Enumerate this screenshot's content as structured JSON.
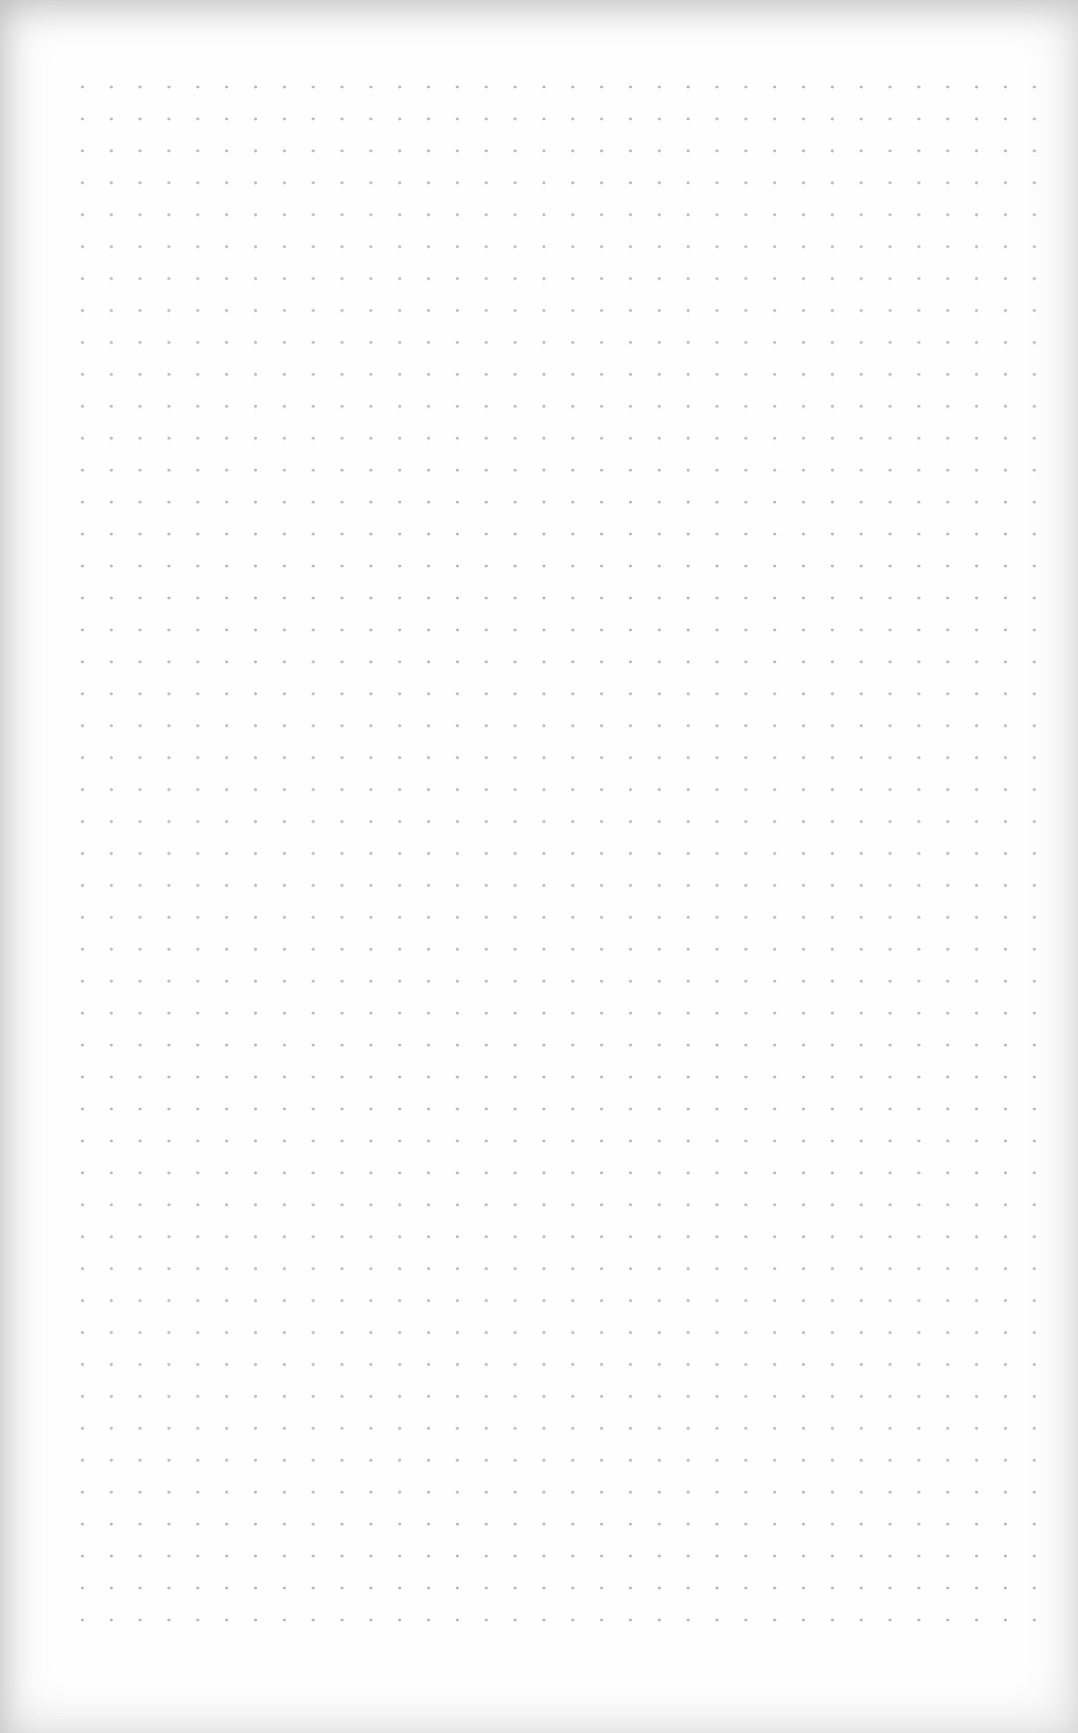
{
  "page": {
    "type": "dot-grid-paper",
    "text_content": "",
    "grid": {
      "columns": 35,
      "rows": 49,
      "spacing_x_px": 28.85,
      "spacing_y_px": 31.95,
      "first_dot": [
        70,
        73
      ],
      "last_dot": [
        1051,
        1608
      ],
      "dot_color": "#999999",
      "background_color": "#fefefe"
    }
  }
}
